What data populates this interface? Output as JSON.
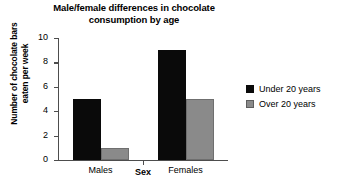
{
  "chart_data": {
    "type": "bar",
    "title": "Male/female differences in chocolate consumption by age",
    "title_line1": "Male/female differences in chocolate",
    "title_line2": "consumption by age",
    "xlabel": "Sex",
    "ylabel": "Number of chocolate bars eaten per week",
    "ylabel_line1": "Number of chocolate bars",
    "ylabel_line2": "eaten per week",
    "categories": [
      "Males",
      "Females"
    ],
    "series": [
      {
        "name": "Under 20 years",
        "color": "#0a0a0a",
        "values": [
          5,
          9
        ]
      },
      {
        "name": "Over 20 years",
        "color": "#8a8a8a",
        "values": [
          1,
          5
        ]
      }
    ],
    "ylim": [
      0,
      10
    ],
    "ytick_labels": [
      "10",
      "8",
      "6",
      "4",
      "2",
      "0"
    ],
    "ytick_values": [
      10,
      8,
      6,
      4,
      2,
      0
    ],
    "grid": false,
    "legend_position": "right"
  }
}
